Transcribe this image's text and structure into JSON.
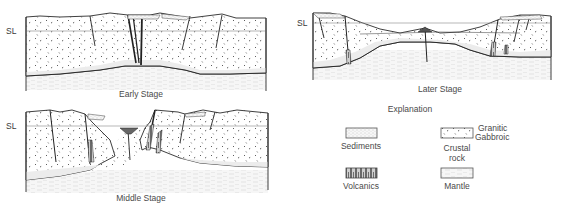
{
  "figure": {
    "sea_level_label": "SL",
    "panels": [
      {
        "id": "early",
        "title": "Early Stage"
      },
      {
        "id": "later",
        "title": "Later Stage"
      },
      {
        "id": "middle",
        "title": "Middle Stage"
      }
    ]
  },
  "legend": {
    "title": "Explanation",
    "items": [
      {
        "id": "sediments",
        "label": "Sediments"
      },
      {
        "id": "volcanics",
        "label": "Volcanics"
      },
      {
        "id": "crustal",
        "label_line1": "Crustal",
        "label_line2": "rock",
        "sub_upper": "Granitic",
        "sub_lower": "Gabbroic"
      },
      {
        "id": "mantle",
        "label": "Mantle"
      }
    ]
  },
  "colors": {
    "line": "#2a2a2a",
    "crust_fill": "#ffffff",
    "lower_crust_fill": "#ececec",
    "mantle_fill": "#f4f4f4",
    "mantle_dash": "#cfcfcf",
    "sea_level_line": "#9a9a9a",
    "volcanics_fill": "#6a6a6a",
    "sediment_fill": "#f6f6f6"
  }
}
